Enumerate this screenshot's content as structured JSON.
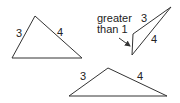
{
  "diagram": {
    "stroke_color": "#333333",
    "triangles": [
      {
        "id": "triangle-acute",
        "vertices": [
          [
            35,
            16
          ],
          [
            12,
            58
          ],
          [
            82,
            58
          ]
        ],
        "side_labels": [
          {
            "text": "3",
            "x": 16,
            "y": 28
          },
          {
            "text": "4",
            "x": 57,
            "y": 27
          }
        ]
      },
      {
        "id": "triangle-thin",
        "vertices": [
          [
            171,
            7
          ],
          [
            133,
            34
          ],
          [
            132,
            55
          ]
        ],
        "side_labels": [
          {
            "text": "3",
            "x": 141,
            "y": 13
          },
          {
            "text": "4",
            "x": 151,
            "y": 34
          }
        ],
        "annotation": {
          "line1": "greater",
          "line2": "than 1",
          "arrow_from": [
            119,
            38
          ],
          "arrow_to": [
            130,
            46
          ]
        }
      },
      {
        "id": "triangle-obtuse",
        "vertices": [
          [
            108,
            68
          ],
          [
            69,
            96
          ],
          [
            167,
            96
          ]
        ],
        "side_labels": [
          {
            "text": "3",
            "x": 80,
            "y": 71
          },
          {
            "text": "4",
            "x": 137,
            "y": 71
          }
        ]
      }
    ]
  }
}
